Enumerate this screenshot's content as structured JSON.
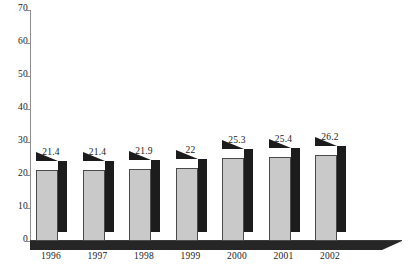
{
  "chart_data": {
    "type": "bar",
    "title": "",
    "subtitle": "",
    "xlabel": "",
    "ylabel": "",
    "categories": [
      "1996",
      "1997",
      "1998",
      "1999",
      "2000",
      "2001",
      "2002"
    ],
    "values": [
      21.4,
      21.4,
      21.9,
      22,
      25.3,
      25.4,
      26.2
    ],
    "data_labels": [
      "21.4",
      "21.4",
      "21.9",
      "22",
      "25.3",
      "25.4",
      "26.2"
    ],
    "ylim": [
      0,
      70
    ],
    "ytick_step": 10,
    "yticks": [
      70,
      60,
      50,
      40,
      30,
      20,
      10,
      0
    ],
    "ytick_labels": [
      "70",
      "60",
      "50",
      "40",
      "30",
      "20",
      "10",
      "0"
    ],
    "grid": false,
    "legend": false,
    "legend_position": "none",
    "series": [
      {
        "name": "",
        "values": [
          21.4,
          21.4,
          21.9,
          22,
          25.3,
          25.4,
          26.2
        ]
      }
    ],
    "style": {
      "bar_face_color": "#c9c9c9",
      "bar_shade_color": "#1c1c1c",
      "axis_color": "#8d8d8d",
      "text_color": "#1a1a1a",
      "background": "#ffffff",
      "three_d": true
    }
  }
}
